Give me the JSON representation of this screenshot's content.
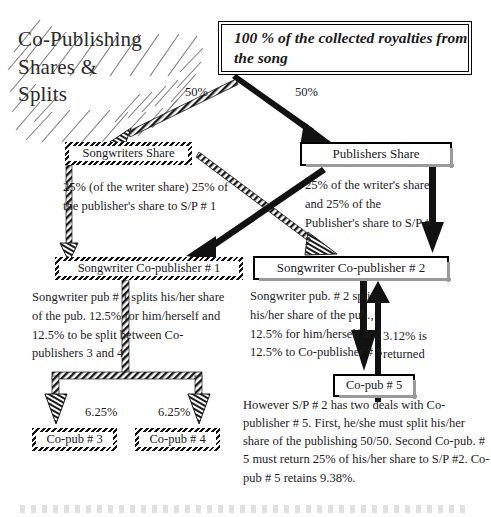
{
  "title": {
    "line1": "Co-Publishing",
    "line2": "Shares &",
    "line3": "Splits"
  },
  "boxes": {
    "top": "100 % of the collected royalties from the song",
    "songwriters_share": "Songwriters Share",
    "publishers_share": "Publishers Share",
    "sw_copub_1": "Songwriter Co-publisher # 1",
    "sw_copub_2": "Songwriter Co-publisher # 2",
    "copub_5": "Co-pub # 5",
    "copub_3": "Co-pub # 3",
    "copub_4": "Co-pub # 4"
  },
  "labels": {
    "split_left": "50%",
    "split_right": "50%",
    "share_3": "6.25%",
    "share_4": "6.25%",
    "returned": "3.12% is returned"
  },
  "notes": {
    "songwriter_share_note": "25% (of the writer share) 25% of the publisher's share to S/P # 1",
    "publisher_share_note": "25% of the writer's share and 25% of the Publisher's share to S/P # 2",
    "copub1_note": "Songwriter pub # 1 splits his/her share of the pub. 12.5% for him/herself and 12.5% to be split between Co-publishers 3 and 4.",
    "copub2_note": "Songwriter pub. # 2 splits his/her share of the pub., 12.5% for him/herself and 12.5% to Co-publisher # 5",
    "however_note": "However S/P # 2 has two deals with Co-publisher # 5.  First, he/she must split his/her share of the publishing 50/50. Second Co-pub. # 5 must return 25% of his/her share to S/P #2.  Co-pub # 5 retains 9.38%."
  },
  "colors": {
    "ink": "#1a1a1a",
    "shadow": "#9a9a9a",
    "paper": "#ffffff"
  }
}
